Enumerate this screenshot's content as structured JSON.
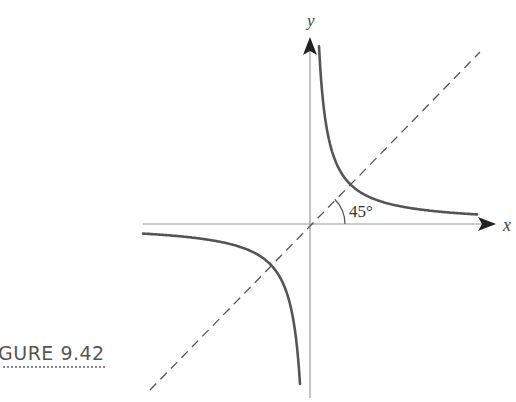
{
  "figure": {
    "caption": "GURE 9.42",
    "x_label": "x",
    "y_label": "y",
    "angle_label": "45°",
    "colors": {
      "axis": "#9a9a9a",
      "curve": "#555555",
      "dashed": "#555555",
      "arrow": "#222222",
      "caption": "#555555"
    }
  },
  "chart_data": {
    "type": "line",
    "title": "",
    "xlabel": "x",
    "ylabel": "y",
    "series": [
      {
        "name": "hyperbola branch (first quadrant)",
        "style": "solid",
        "equation": "y = k/x, x > 0"
      },
      {
        "name": "hyperbola branch (third quadrant)",
        "style": "solid",
        "equation": "y = k/x, x < 0"
      },
      {
        "name": "line y = x",
        "style": "dashed",
        "angle_deg": 45
      }
    ],
    "annotations": [
      "45°"
    ],
    "grid": false
  }
}
